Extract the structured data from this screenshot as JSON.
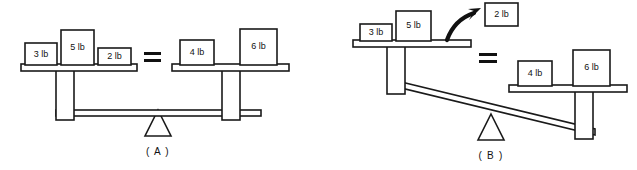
{
  "figure": {
    "background_color": "#ffffff",
    "line_color": "#1a1a1a",
    "fill_color": "#ffffff"
  },
  "panels": [
    {
      "id": "A",
      "label": "( A )",
      "state": "balanced",
      "equals_sign": "=",
      "left_pan": {
        "name": "left-pan",
        "blocks": [
          {
            "label": "3 lb",
            "weight": 3,
            "unit": "lb"
          },
          {
            "label": "5 lb",
            "weight": 5,
            "unit": "lb"
          },
          {
            "label": "2 lb",
            "weight": 2,
            "unit": "lb"
          }
        ],
        "total_weight": 10
      },
      "right_pan": {
        "name": "right-pan",
        "blocks": [
          {
            "label": "4 lb",
            "weight": 4,
            "unit": "lb"
          },
          {
            "label": "6 lb",
            "weight": 6,
            "unit": "lb"
          }
        ],
        "total_weight": 10
      }
    },
    {
      "id": "B",
      "label": "( B )",
      "state": "tilted-left-down",
      "equals_sign": "=",
      "left_pan": {
        "name": "left-pan",
        "blocks": [
          {
            "label": "3 lb",
            "weight": 3,
            "unit": "lb"
          },
          {
            "label": "5 lb",
            "weight": 5,
            "unit": "lb"
          }
        ],
        "total_weight": 8
      },
      "right_pan": {
        "name": "right-pan",
        "blocks": [
          {
            "label": "4 lb",
            "weight": 4,
            "unit": "lb"
          },
          {
            "label": "6 lb",
            "weight": 6,
            "unit": "lb"
          }
        ],
        "total_weight": 10
      },
      "removed_block": {
        "label": "2 lb",
        "weight": 2,
        "unit": "lb",
        "annotation": "removed-block"
      },
      "arrow": {
        "name": "curved-removal-arrow",
        "direction": "up-right"
      }
    }
  ]
}
